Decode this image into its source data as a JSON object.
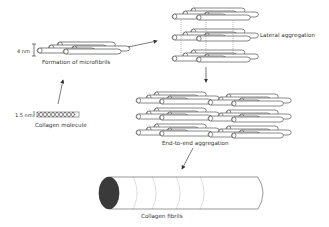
{
  "diagram": {
    "stages": [
      {
        "id": "molecule",
        "label": "Collagen molecule",
        "dimension": "1.5 nm"
      },
      {
        "id": "microfibril",
        "label": "Formation of microfibrils",
        "dimension": "4 nm"
      },
      {
        "id": "lateral",
        "label": "Lateral aggregation"
      },
      {
        "id": "end_to_end",
        "label": "End-to-end aggregation"
      },
      {
        "id": "fibril",
        "label": "Collagen fibrils"
      }
    ],
    "arrows": [
      {
        "from": "molecule",
        "to": "microfibril"
      },
      {
        "from": "microfibril",
        "to": "lateral"
      },
      {
        "from": "lateral",
        "to": "end_to_end"
      },
      {
        "from": "end_to_end",
        "to": "fibril"
      }
    ]
  }
}
